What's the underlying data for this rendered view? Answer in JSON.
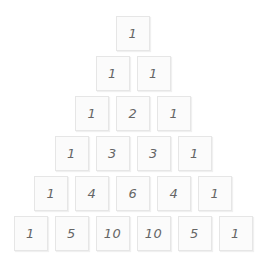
{
  "rows": [
    [
      1
    ],
    [
      1,
      1
    ],
    [
      1,
      2,
      1
    ],
    [
      1,
      3,
      3,
      1
    ],
    [
      1,
      4,
      6,
      4,
      1
    ],
    [
      1,
      5,
      10,
      10,
      5,
      1
    ]
  ],
  "colors": {
    "background": "#ffffff",
    "cell_fill": "#fbfbfb",
    "cell_border": "#e6e6e6",
    "text": "#666666"
  }
}
